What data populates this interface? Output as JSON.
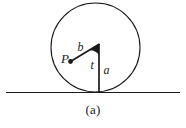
{
  "figure": {
    "caption": "(a)",
    "background_color": "#ffffff",
    "stroke_color": "#1a1a1a",
    "labels": [
      {
        "id": "point-p",
        "text": "P",
        "x": 62,
        "y": 62,
        "font_size": 12
      },
      {
        "id": "segment-b",
        "text": "b",
        "x": 78,
        "y": 50,
        "font_size": 11
      },
      {
        "id": "angle-t",
        "text": "t",
        "x": 91,
        "y": 68,
        "font_size": 11
      },
      {
        "id": "segment-a",
        "text": "a",
        "x": 104,
        "y": 73,
        "font_size": 11
      }
    ],
    "geometry": {
      "circle": {
        "cx": 95.5,
        "cy": 47.5,
        "r": 44.5,
        "stroke_width": 1.1
      },
      "ground_line": {
        "x1": 6,
        "y1": 92.5,
        "x2": 180,
        "y2": 92.5,
        "stroke_width": 1.1
      },
      "radius_line": {
        "x1": 99,
        "y1": 44,
        "x2": 99,
        "y2": 92.5,
        "stroke_width": 1.6
      },
      "chord_line": {
        "x1": 99,
        "y1": 44,
        "x2": 70.5,
        "y2": 61.5,
        "stroke_width": 1.6
      },
      "point_marker": {
        "cx": 70.5,
        "cy": 61.5,
        "r": 2.2
      },
      "angle_wedge": {
        "cx": 99,
        "cy": 44,
        "r": 11,
        "from": "vertical-down",
        "to": "chord"
      }
    }
  }
}
